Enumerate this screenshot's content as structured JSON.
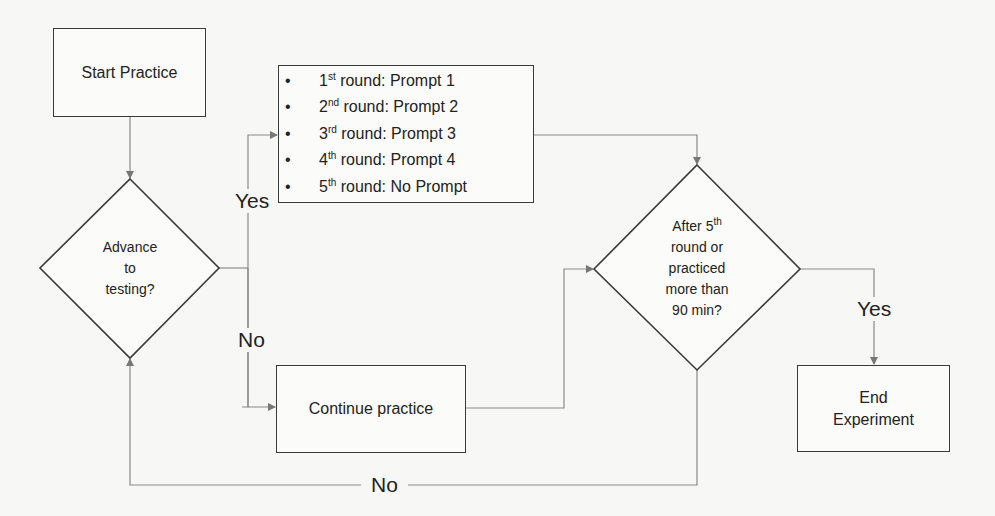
{
  "nodes": {
    "start": {
      "label": "Start Practice"
    },
    "advance_decision": {
      "lines": [
        "Advance",
        "to",
        "testing?"
      ]
    },
    "prompt_list": {
      "items": [
        {
          "num": "1",
          "sup": "st",
          "text": " round: Prompt 1"
        },
        {
          "num": "2",
          "sup": "nd",
          "text": " round: Prompt 2"
        },
        {
          "num": "3",
          "sup": "rd",
          "text": " round: Prompt 3"
        },
        {
          "num": "4",
          "sup": "th",
          "text": " round: Prompt 4"
        },
        {
          "num": "5",
          "sup": "th",
          "text": " round: No Prompt"
        }
      ]
    },
    "continue": {
      "label": "Continue practice"
    },
    "end_decision": {
      "line1_pre": "After 5",
      "line1_sup": "th",
      "lines": [
        "round or",
        "practiced",
        "more than",
        "90 min?"
      ]
    },
    "end": {
      "lines": [
        "End",
        "Experiment"
      ]
    }
  },
  "edges": {
    "advance_yes": "Yes",
    "advance_no": "No",
    "end_yes": "Yes",
    "loop_no": "No"
  },
  "colors": {
    "stroke": "#3a3a3a",
    "connector": "#8a8a8a",
    "background": "#f7f7f5"
  }
}
